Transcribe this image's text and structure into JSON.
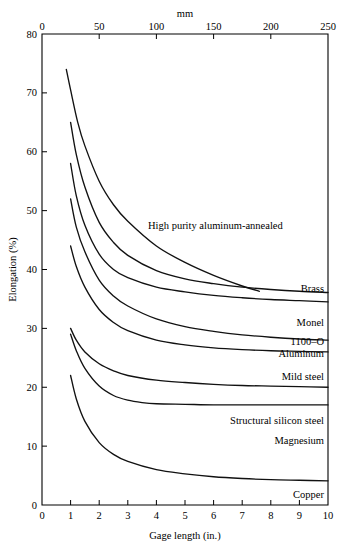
{
  "chart_data": {
    "type": "line",
    "title": "",
    "xlabel": "Gage length (in.)",
    "ylabel": "Elongation (%)",
    "top_axis_label": "mm",
    "xlim": [
      0,
      10
    ],
    "ylim": [
      0,
      80
    ],
    "top_xlim": [
      0,
      250
    ],
    "x_ticks": [
      "0",
      "1",
      "2",
      "3",
      "4",
      "5",
      "6",
      "7",
      "8",
      "9",
      "10"
    ],
    "y_ticks": [
      "0",
      "10",
      "20",
      "30",
      "40",
      "50",
      "60",
      "70",
      "80"
    ],
    "top_x_ticks": [
      "0",
      "50",
      "100",
      "150",
      "200",
      "250"
    ],
    "grid": false,
    "legend_position": "inline-right",
    "series": [
      {
        "name": "High purity aluminum-annealed",
        "label": "High purity aluminum-annealed",
        "x": [
          0.85,
          1.0,
          1.25,
          1.5,
          2.0,
          2.5,
          3.0,
          4.0,
          5.0,
          6.0,
          7.0,
          7.6
        ],
        "y": [
          74.0,
          70.5,
          65.0,
          61.0,
          55.0,
          51.0,
          48.2,
          44.0,
          41.2,
          39.0,
          37.2,
          36.3
        ]
      },
      {
        "name": "Brass",
        "label": "Brass",
        "x": [
          1.0,
          1.2,
          1.5,
          2.0,
          2.5,
          3.0,
          4.0,
          5.0,
          6.0,
          7.0,
          8.0,
          9.0,
          10.0
        ],
        "y": [
          65.0,
          59.5,
          54.0,
          48.0,
          44.6,
          42.4,
          39.8,
          38.4,
          37.6,
          37.0,
          36.6,
          36.3,
          36.1
        ]
      },
      {
        "name": "Monel",
        "label": "Monel",
        "x": [
          1.0,
          1.2,
          1.5,
          2.0,
          2.5,
          3.0,
          4.0,
          5.0,
          6.0,
          7.0,
          8.0,
          9.0,
          10.0
        ],
        "y": [
          58.0,
          52.5,
          47.5,
          42.6,
          40.0,
          38.6,
          37.0,
          36.2,
          35.6,
          35.2,
          34.9,
          34.7,
          34.5
        ]
      },
      {
        "name": "1100-O Aluminum",
        "label": "1100–O",
        "label2": "Aluminum",
        "x": [
          1.0,
          1.2,
          1.5,
          2.0,
          2.5,
          3.0,
          4.0,
          5.0,
          6.0,
          7.0,
          8.0,
          9.0,
          10.0
        ],
        "y": [
          52.0,
          47.2,
          43.0,
          38.2,
          35.5,
          33.8,
          31.6,
          30.3,
          29.5,
          28.9,
          28.5,
          28.2,
          28.0
        ]
      },
      {
        "name": "Mild steel",
        "label": "Mild steel",
        "x": [
          1.0,
          1.2,
          1.5,
          2.0,
          2.5,
          3.0,
          4.0,
          5.0,
          6.0,
          7.0,
          8.0,
          9.0,
          10.0
        ],
        "y": [
          44.0,
          40.5,
          37.0,
          33.2,
          31.0,
          29.6,
          28.0,
          27.2,
          26.7,
          26.4,
          26.2,
          26.1,
          26.0
        ]
      },
      {
        "name": "Structural silicon steel",
        "label": "Structural silicon steel",
        "x": [
          1.0,
          1.2,
          1.5,
          2.0,
          2.5,
          3.0,
          4.0,
          5.0,
          6.0,
          7.0,
          8.0,
          9.0,
          10.0
        ],
        "y": [
          30.0,
          28.0,
          26.0,
          24.0,
          22.8,
          22.0,
          21.2,
          20.8,
          20.5,
          20.3,
          20.2,
          20.1,
          20.0
        ]
      },
      {
        "name": "Magnesium",
        "label": "Magnesium",
        "x": [
          1.0,
          1.2,
          1.5,
          2.0,
          2.5,
          3.0,
          3.5,
          4.0,
          5.0,
          6.0,
          7.0,
          8.0,
          9.0,
          10.0
        ],
        "y": [
          29.0,
          26.2,
          23.2,
          20.2,
          18.6,
          17.8,
          17.4,
          17.2,
          17.1,
          17.0,
          17.0,
          17.0,
          17.0,
          17.0
        ]
      },
      {
        "name": "Copper",
        "label": "Copper",
        "x": [
          1.0,
          1.2,
          1.5,
          2.0,
          2.5,
          3.0,
          4.0,
          5.0,
          6.0,
          7.0,
          8.0,
          9.0,
          10.0
        ],
        "y": [
          22.0,
          18.0,
          14.2,
          10.6,
          8.6,
          7.4,
          6.0,
          5.3,
          4.8,
          4.5,
          4.3,
          4.2,
          4.1
        ]
      }
    ]
  }
}
